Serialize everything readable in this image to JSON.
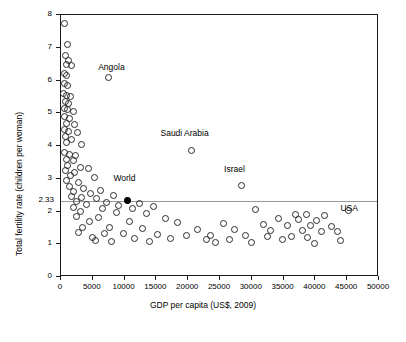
{
  "chart_data": {
    "type": "scatter",
    "title": "",
    "xlabel": "GDP per capita (US$, 2009)",
    "ylabel": "Total fertility rate (children per woman)",
    "xlim": [
      0,
      50000
    ],
    "ylim": [
      0,
      8
    ],
    "xticks": [
      0,
      5000,
      10000,
      15000,
      20000,
      25000,
      30000,
      35000,
      40000,
      45000,
      50000
    ],
    "xticklabels": [
      "0",
      "5000",
      "10000",
      "15000",
      "20000",
      "25000",
      "30000",
      "35000",
      "40000",
      "45000",
      "50000"
    ],
    "yticks": [
      0,
      1,
      2,
      3,
      4,
      5,
      6,
      7,
      8
    ],
    "yticklabels": [
      "0",
      "1",
      "2",
      "3",
      "4",
      "5",
      "6",
      "7",
      "8"
    ],
    "grid": false,
    "legend": null,
    "reference_line": {
      "axis": "y",
      "value": 2.33,
      "label": "2.33",
      "color": "#9a9a9a"
    },
    "annotations": [
      {
        "text": "Angola",
        "x": 6000,
        "y": 6.35
      },
      {
        "text": "Saudi Arabia",
        "x": 15800,
        "y": 4.35
      },
      {
        "text": "Israel",
        "x": 25800,
        "y": 3.25
      },
      {
        "text": "World",
        "x": 8400,
        "y": 2.95
      },
      {
        "text": "USA",
        "x": 44100,
        "y": 2.05
      }
    ],
    "points": [
      {
        "x": 600,
        "y": 7.75
      },
      {
        "x": 1000,
        "y": 7.1
      },
      {
        "x": 700,
        "y": 6.75
      },
      {
        "x": 1250,
        "y": 6.6
      },
      {
        "x": 800,
        "y": 6.5
      },
      {
        "x": 1600,
        "y": 6.45
      },
      {
        "x": 500,
        "y": 6.2
      },
      {
        "x": 900,
        "y": 6.15
      },
      {
        "x": 7400,
        "y": 6.1
      },
      {
        "x": 600,
        "y": 5.9
      },
      {
        "x": 1100,
        "y": 5.85
      },
      {
        "x": 450,
        "y": 5.6
      },
      {
        "x": 850,
        "y": 5.55
      },
      {
        "x": 1500,
        "y": 5.5
      },
      {
        "x": 700,
        "y": 5.35
      },
      {
        "x": 1250,
        "y": 5.3
      },
      {
        "x": 500,
        "y": 5.15
      },
      {
        "x": 1000,
        "y": 5.1
      },
      {
        "x": 1900,
        "y": 5.05
      },
      {
        "x": 600,
        "y": 4.9
      },
      {
        "x": 1400,
        "y": 4.85
      },
      {
        "x": 800,
        "y": 4.7
      },
      {
        "x": 2100,
        "y": 4.65
      },
      {
        "x": 550,
        "y": 4.5
      },
      {
        "x": 1200,
        "y": 4.45
      },
      {
        "x": 2600,
        "y": 4.4
      },
      {
        "x": 700,
        "y": 4.3
      },
      {
        "x": 1600,
        "y": 4.2
      },
      {
        "x": 900,
        "y": 4.1
      },
      {
        "x": 3200,
        "y": 4.05
      },
      {
        "x": 20500,
        "y": 3.85
      },
      {
        "x": 600,
        "y": 3.8
      },
      {
        "x": 1400,
        "y": 3.75
      },
      {
        "x": 2300,
        "y": 3.7
      },
      {
        "x": 800,
        "y": 3.6
      },
      {
        "x": 1900,
        "y": 3.55
      },
      {
        "x": 1100,
        "y": 3.4
      },
      {
        "x": 3000,
        "y": 3.35
      },
      {
        "x": 4300,
        "y": 3.3
      },
      {
        "x": 700,
        "y": 3.25
      },
      {
        "x": 2200,
        "y": 3.2
      },
      {
        "x": 1500,
        "y": 3.1
      },
      {
        "x": 5200,
        "y": 3.05
      },
      {
        "x": 900,
        "y": 2.95
      },
      {
        "x": 2800,
        "y": 2.9
      },
      {
        "x": 28400,
        "y": 2.78
      },
      {
        "x": 1300,
        "y": 2.75
      },
      {
        "x": 3600,
        "y": 2.7
      },
      {
        "x": 6200,
        "y": 2.65
      },
      {
        "x": 2000,
        "y": 2.6
      },
      {
        "x": 4700,
        "y": 2.55
      },
      {
        "x": 8200,
        "y": 2.5
      },
      {
        "x": 1700,
        "y": 2.45
      },
      {
        "x": 3300,
        "y": 2.42
      },
      {
        "x": 5600,
        "y": 2.4
      },
      {
        "x": 10400,
        "y": 2.33
      },
      {
        "x": 2500,
        "y": 2.3
      },
      {
        "x": 7100,
        "y": 2.28
      },
      {
        "x": 12300,
        "y": 2.25
      },
      {
        "x": 4000,
        "y": 2.2
      },
      {
        "x": 9000,
        "y": 2.18
      },
      {
        "x": 14500,
        "y": 2.15
      },
      {
        "x": 1900,
        "y": 2.12
      },
      {
        "x": 6500,
        "y": 2.1
      },
      {
        "x": 11200,
        "y": 2.08
      },
      {
        "x": 30600,
        "y": 2.05
      },
      {
        "x": 45200,
        "y": 2.02
      },
      {
        "x": 3100,
        "y": 2.0
      },
      {
        "x": 8700,
        "y": 1.98
      },
      {
        "x": 13500,
        "y": 1.95
      },
      {
        "x": 36800,
        "y": 1.92
      },
      {
        "x": 38600,
        "y": 1.9
      },
      {
        "x": 41500,
        "y": 1.88
      },
      {
        "x": 2400,
        "y": 1.85
      },
      {
        "x": 5900,
        "y": 1.82
      },
      {
        "x": 16500,
        "y": 1.8
      },
      {
        "x": 34200,
        "y": 1.78
      },
      {
        "x": 37400,
        "y": 1.75
      },
      {
        "x": 40100,
        "y": 1.73
      },
      {
        "x": 4500,
        "y": 1.7
      },
      {
        "x": 10800,
        "y": 1.68
      },
      {
        "x": 18300,
        "y": 1.65
      },
      {
        "x": 25600,
        "y": 1.63
      },
      {
        "x": 31800,
        "y": 1.6
      },
      {
        "x": 35600,
        "y": 1.58
      },
      {
        "x": 39200,
        "y": 1.57
      },
      {
        "x": 42600,
        "y": 1.55
      },
      {
        "x": 3400,
        "y": 1.52
      },
      {
        "x": 7600,
        "y": 1.5
      },
      {
        "x": 12800,
        "y": 1.48
      },
      {
        "x": 21500,
        "y": 1.46
      },
      {
        "x": 27300,
        "y": 1.45
      },
      {
        "x": 33000,
        "y": 1.43
      },
      {
        "x": 37900,
        "y": 1.42
      },
      {
        "x": 41000,
        "y": 1.4
      },
      {
        "x": 43500,
        "y": 1.38
      },
      {
        "x": 2700,
        "y": 1.35
      },
      {
        "x": 6800,
        "y": 1.33
      },
      {
        "x": 9800,
        "y": 1.32
      },
      {
        "x": 15200,
        "y": 1.3
      },
      {
        "x": 19800,
        "y": 1.28
      },
      {
        "x": 23500,
        "y": 1.27
      },
      {
        "x": 29000,
        "y": 1.26
      },
      {
        "x": 32400,
        "y": 1.25
      },
      {
        "x": 36200,
        "y": 1.24
      },
      {
        "x": 38800,
        "y": 1.22
      },
      {
        "x": 4900,
        "y": 1.2
      },
      {
        "x": 11600,
        "y": 1.18
      },
      {
        "x": 17200,
        "y": 1.17
      },
      {
        "x": 22800,
        "y": 1.15
      },
      {
        "x": 26500,
        "y": 1.14
      },
      {
        "x": 34800,
        "y": 1.13
      },
      {
        "x": 44000,
        "y": 1.12
      },
      {
        "x": 5500,
        "y": 1.1
      },
      {
        "x": 8000,
        "y": 1.08
      },
      {
        "x": 13900,
        "y": 1.07
      },
      {
        "x": 24300,
        "y": 1.05
      },
      {
        "x": 30000,
        "y": 1.04
      },
      {
        "x": 39800,
        "y": 1.03
      }
    ],
    "highlight_point": {
      "x": 10400,
      "y": 2.33,
      "label": "World"
    }
  }
}
